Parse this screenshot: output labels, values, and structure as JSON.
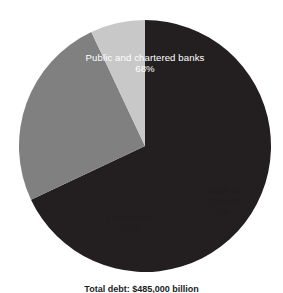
{
  "chart_data": {
    "type": "pie",
    "title": "",
    "subtitle": "",
    "xlabel": "",
    "ylabel": "",
    "legend_position": "none",
    "grid": false,
    "start_angle_deg": 0,
    "direction": "clockwise",
    "categories": [
      "Public and chartered banks",
      "Foreigners",
      "Bank of Canada"
    ],
    "values": [
      68,
      25,
      7
    ],
    "value_unit": "%",
    "slices": [
      {
        "label": "Public and chartered banks",
        "value": 68,
        "value_text": "68%",
        "color": "#231f20",
        "text_color": "#ffffff"
      },
      {
        "label": "Foreigners",
        "value": 25,
        "value_text": "25%",
        "color": "#808080",
        "text_color": "#201d1e"
      },
      {
        "label": "Bank of Canada",
        "value": 7,
        "value_text": "7%",
        "color": "#c8c8c8",
        "text_color": "#201d1e"
      }
    ],
    "caption": "Total debt: $485,000 billion"
  },
  "figure": {
    "background": "#ffffff",
    "caption_partial": "Total debt: $485,000 billion"
  },
  "labels": {
    "banks": {
      "name": "Public and chartered banks",
      "value": "68%"
    },
    "foreigners": {
      "name": "Foreigners",
      "value": "25%"
    },
    "bank_of_canada": {
      "name": "Bank of Canada",
      "value": "7%"
    }
  }
}
